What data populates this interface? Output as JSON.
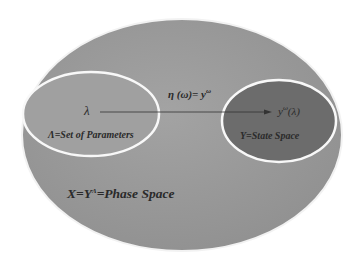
{
  "diagram": {
    "outer": {
      "label": "X=Y",
      "sup": "Λ",
      "label_rest": "=Phase Space",
      "fill": "#9a9a9a",
      "stroke": "#f4f4f4"
    },
    "left": {
      "symbol": "λ",
      "label": "Λ=Set of Parameters",
      "fill": "#9e9e9e",
      "stroke": "#f6f6f6"
    },
    "right": {
      "symbol": "y",
      "symbol_sup": "ω",
      "symbol_rest": "(λ)",
      "label": "Y=State Space",
      "fill": "#6e6e6e",
      "stroke": "#f6f6f6"
    },
    "mapping": {
      "label": "η (ω)= y",
      "sup": "ω"
    }
  }
}
